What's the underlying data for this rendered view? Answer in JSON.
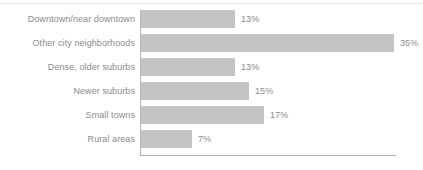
{
  "chart_data": {
    "type": "bar",
    "orientation": "horizontal",
    "title": "",
    "subtitle": "",
    "xlabel": "",
    "ylabel": "",
    "grid": false,
    "legend": null,
    "xlim": [
      0,
      35
    ],
    "categories": [
      "Downtown/near downtown",
      "Other city neighborhoods",
      "Dense, older suburbs",
      "Newer suburbs",
      "Small towns",
      "Rural areas"
    ],
    "values": [
      13,
      35,
      13,
      15,
      17,
      7
    ],
    "value_labels": [
      "13%",
      "35%",
      "13%",
      "15%",
      "17%",
      "7%"
    ],
    "bars": [
      {
        "category": "Downtown/near downtown",
        "value": 13,
        "label": "13%"
      },
      {
        "category": "Other city neighborhoods",
        "value": 35,
        "label": "35%"
      },
      {
        "category": "Dense, older suburbs",
        "value": 13,
        "label": "13%"
      },
      {
        "category": "Newer suburbs",
        "value": 15,
        "label": "15%"
      },
      {
        "category": "Small towns",
        "value": 17,
        "label": "17%"
      },
      {
        "category": "Rural areas",
        "value": 7,
        "label": "7%"
      }
    ]
  },
  "style": {
    "bar_color": "#c4c4c4",
    "text_color": "#8b8b8b",
    "axis_color": "#b0b0b0",
    "rule_color": "#e3e3e3",
    "background": "#ffffff"
  },
  "scale": {
    "px_per_unit": 7.22,
    "bar_origin_x": 141,
    "bar_height": 18,
    "row_height": 24,
    "value_label_gap": 6
  }
}
